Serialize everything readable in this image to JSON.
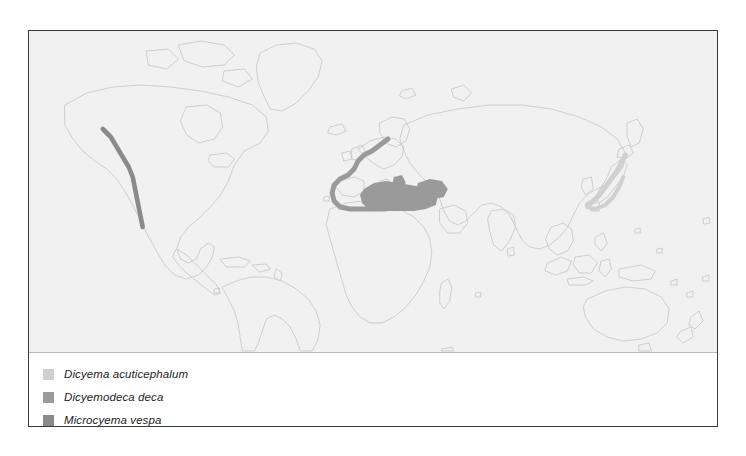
{
  "figure": {
    "background": "#ffffff",
    "border_color": "#3a3a3a",
    "map_background": "#f1f1f1"
  },
  "map": {
    "projection_note": "world map, equirectangular, continent outlines only",
    "outline_color": "#c9c9c9",
    "regions": [
      {
        "id": "japan-coast",
        "species": "Dicyema acuticephalum",
        "color": "#d0d0d0",
        "location": "coastal waters of Japan, Sea of Japan and Pacific coast of Honshu/Kyushu"
      },
      {
        "id": "mediterranean-ne-atlantic",
        "species": "Dicyemodeca deca",
        "color": "#9a9a9a",
        "location": "Mediterranean Sea and northeast Atlantic coast from North Sea to Morocco"
      },
      {
        "id": "ne-pacific-coast",
        "species": "Microcyema vespa",
        "color": "#8a8a8a",
        "location": "northeast Pacific coast of North America, British Columbia to California"
      }
    ]
  },
  "legend": {
    "items": [
      {
        "label": "Dicyema acuticephalum",
        "color": "#d0d0d0"
      },
      {
        "label": "Dicyemodeca deca",
        "color": "#9a9a9a"
      },
      {
        "label": "Microcyema vespa",
        "color": "#8a8a8a"
      }
    ]
  }
}
